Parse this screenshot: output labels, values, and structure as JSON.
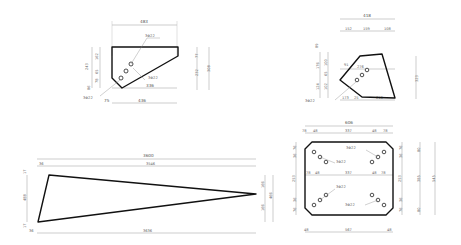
{
  "drawing": {
    "colors": {
      "outline": "#111111",
      "dimension": "#9a9a9a",
      "text": "#555555",
      "background": "#ffffff"
    },
    "shape_a": {
      "label_rebar": [
        "3Φ22",
        "3Φ22",
        "3Φ22"
      ],
      "dims": {
        "top_width": "483",
        "bottom_left": "75",
        "bottom_right": "436",
        "inner_width": "336",
        "left_total": "243",
        "left_a": "162",
        "left_b": "65",
        "left_c": "78",
        "left_d": "86",
        "right_top": "77",
        "right_mid": "232",
        "right_total": "308"
      }
    },
    "shape_b": {
      "label_rebar": [
        "3Φ22"
      ],
      "dims": {
        "top_total": "418",
        "top_a": "152",
        "top_b": "159",
        "top_c": "108",
        "inner_top": "276",
        "inner_left": "91",
        "left_top": "89",
        "left_a": "176",
        "left_b": "100",
        "left_c": "65",
        "left_d": "124",
        "left_e": "102",
        "right_total": "323",
        "bottom_a": "173",
        "bottom_b": "25",
        "bottom_c": "218"
      }
    },
    "shape_c": {
      "label_rebar": [
        "3Φ22",
        "3Φ22",
        "3Φ22",
        "3Φ22"
      ],
      "dims": {
        "top_total": "606",
        "top_a": "78",
        "top_b": "48",
        "top_mid": "337",
        "top_c": "48",
        "top_d": "78",
        "mid_a": "78",
        "mid_b": "48",
        "mid_mid": "337",
        "mid_c": "48",
        "mid_d": "78",
        "left_a": "76",
        "left_b": "36",
        "left_mid": "253",
        "left_c": "36",
        "left_d": "76",
        "right_a": "76",
        "right_b": "36",
        "right_mid": "253",
        "right_c": "36",
        "right_d": "76",
        "right_outer_top": "80",
        "right_outer_mid": "385",
        "right_outer_bottom": "80",
        "right_total": "545",
        "bottom_a": "48",
        "bottom_mid": "567",
        "bottom_b": "48"
      }
    },
    "shape_d": {
      "dims": {
        "top_total": "3600",
        "top_a": "36",
        "top_b": "3546",
        "bottom_total": "3636",
        "bottom_a": "36",
        "left_total": "488",
        "left_a": "17",
        "left_b": "17",
        "right_a": "166",
        "right_b": "166",
        "right_total": "466"
      }
    }
  }
}
